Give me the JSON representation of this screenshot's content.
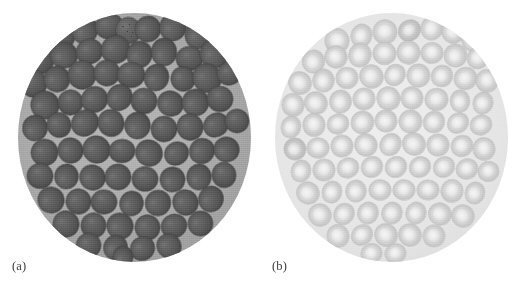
{
  "figure": {
    "type": "micrograph-figure",
    "background_color": "#ffffff",
    "width": 525,
    "height": 285,
    "panel_count": 2
  },
  "panels": [
    {
      "id": "a",
      "label": "(a)",
      "field_shape": "circle",
      "field_background_color": "#aeaeae",
      "cell_fill_color": "#5a5a5a",
      "cell_edge_color": "#4e4e4e",
      "contrast": "high",
      "appearance": "dark densely packed rounded cells on mid-gray field",
      "cell_count": 64
    },
    {
      "id": "b",
      "label": "(b)",
      "field_shape": "circle",
      "field_background_color": "#e8e8e8",
      "cell_fill_color": "#d4d4d4",
      "cell_edge_color": "#c2c2c2",
      "contrast": "low",
      "appearance": "pale biconcave cells with light centers on near-white field",
      "cell_count": 78
    }
  ],
  "cells_a": [
    {
      "x": 41,
      "y": 23,
      "r": 15.5,
      "k": "p"
    },
    {
      "x": 66,
      "y": 16,
      "r": 14.5,
      "k": "p"
    },
    {
      "x": 91,
      "y": 13,
      "r": 14.0,
      "k": "p"
    },
    {
      "x": 110,
      "y": 17,
      "r": 12.5,
      "k": "spk"
    },
    {
      "x": 130,
      "y": 16,
      "r": 13.0,
      "k": "p"
    },
    {
      "x": 155,
      "y": 14,
      "r": 14.0,
      "k": "p"
    },
    {
      "x": 180,
      "y": 21,
      "r": 14.5,
      "k": "p"
    },
    {
      "x": 21,
      "y": 46,
      "r": 14.5,
      "k": "p"
    },
    {
      "x": 46,
      "y": 42,
      "r": 13.0,
      "k": "p"
    },
    {
      "x": 71,
      "y": 38,
      "r": 13.5,
      "k": "p"
    },
    {
      "x": 97,
      "y": 36,
      "r": 14.5,
      "k": "p"
    },
    {
      "x": 121,
      "y": 41,
      "r": 13.5,
      "k": "p"
    },
    {
      "x": 146,
      "y": 39,
      "r": 14.0,
      "k": "p"
    },
    {
      "x": 171,
      "y": 45,
      "r": 13.5,
      "k": "p"
    },
    {
      "x": 196,
      "y": 40,
      "r": 14.5,
      "k": "p"
    },
    {
      "x": 15,
      "y": 70,
      "r": 13.5,
      "k": "p"
    },
    {
      "x": 39,
      "y": 66,
      "r": 13.0,
      "k": "p"
    },
    {
      "x": 64,
      "y": 62,
      "r": 14.0,
      "k": "p"
    },
    {
      "x": 89,
      "y": 60,
      "r": 13.0,
      "k": "p"
    },
    {
      "x": 113,
      "y": 62,
      "r": 14.0,
      "k": "p"
    },
    {
      "x": 138,
      "y": 64,
      "r": 13.5,
      "k": "p"
    },
    {
      "x": 165,
      "y": 66,
      "r": 12.0,
      "k": "p"
    },
    {
      "x": 189,
      "y": 65,
      "r": 14.0,
      "k": "p"
    },
    {
      "x": 211,
      "y": 60,
      "r": 12.5,
      "k": "p"
    },
    {
      "x": 27,
      "y": 92,
      "r": 14.0,
      "k": "p"
    },
    {
      "x": 52,
      "y": 89,
      "r": 12.5,
      "k": "p"
    },
    {
      "x": 76,
      "y": 86,
      "r": 13.5,
      "k": "p"
    },
    {
      "x": 101,
      "y": 84,
      "r": 13.5,
      "k": "p"
    },
    {
      "x": 126,
      "y": 88,
      "r": 13.0,
      "k": "p"
    },
    {
      "x": 152,
      "y": 90,
      "r": 12.5,
      "k": "p"
    },
    {
      "x": 177,
      "y": 89,
      "r": 13.5,
      "k": "p"
    },
    {
      "x": 202,
      "y": 86,
      "r": 13.0,
      "k": "p"
    },
    {
      "x": 17,
      "y": 115,
      "r": 13.0,
      "k": "p"
    },
    {
      "x": 41,
      "y": 112,
      "r": 12.0,
      "k": "p"
    },
    {
      "x": 67,
      "y": 110,
      "r": 14.0,
      "k": "p"
    },
    {
      "x": 93,
      "y": 110,
      "r": 13.0,
      "k": "p"
    },
    {
      "x": 119,
      "y": 112,
      "r": 13.5,
      "k": "p"
    },
    {
      "x": 146,
      "y": 116,
      "r": 13.0,
      "k": "p"
    },
    {
      "x": 172,
      "y": 114,
      "r": 13.0,
      "k": "p"
    },
    {
      "x": 198,
      "y": 112,
      "r": 13.0,
      "k": "p"
    },
    {
      "x": 219,
      "y": 108,
      "r": 12.0,
      "k": "p"
    },
    {
      "x": 26,
      "y": 139,
      "r": 13.5,
      "k": "p"
    },
    {
      "x": 52,
      "y": 137,
      "r": 12.5,
      "k": "p"
    },
    {
      "x": 78,
      "y": 136,
      "r": 13.5,
      "k": "p"
    },
    {
      "x": 104,
      "y": 138,
      "r": 13.0,
      "k": "p"
    },
    {
      "x": 131,
      "y": 140,
      "r": 13.0,
      "k": "p"
    },
    {
      "x": 158,
      "y": 140,
      "r": 12.5,
      "k": "p"
    },
    {
      "x": 184,
      "y": 138,
      "r": 13.0,
      "k": "p"
    },
    {
      "x": 208,
      "y": 136,
      "r": 12.5,
      "k": "p"
    },
    {
      "x": 22,
      "y": 163,
      "r": 13.0,
      "k": "p"
    },
    {
      "x": 48,
      "y": 163,
      "r": 12.5,
      "k": "p"
    },
    {
      "x": 74,
      "y": 164,
      "r": 12.5,
      "k": "p"
    },
    {
      "x": 100,
      "y": 164,
      "r": 13.0,
      "k": "p"
    },
    {
      "x": 127,
      "y": 166,
      "r": 13.0,
      "k": "p"
    },
    {
      "x": 154,
      "y": 166,
      "r": 12.5,
      "k": "p"
    },
    {
      "x": 181,
      "y": 164,
      "r": 13.0,
      "k": "p"
    },
    {
      "x": 206,
      "y": 162,
      "r": 12.0,
      "k": "p"
    },
    {
      "x": 33,
      "y": 187,
      "r": 13.0,
      "k": "p"
    },
    {
      "x": 60,
      "y": 188,
      "r": 12.5,
      "k": "p"
    },
    {
      "x": 86,
      "y": 189,
      "r": 13.0,
      "k": "p"
    },
    {
      "x": 113,
      "y": 190,
      "r": 12.5,
      "k": "p"
    },
    {
      "x": 140,
      "y": 190,
      "r": 13.0,
      "k": "p"
    },
    {
      "x": 167,
      "y": 189,
      "r": 12.5,
      "k": "p"
    },
    {
      "x": 193,
      "y": 186,
      "r": 13.0,
      "k": "p"
    },
    {
      "x": 48,
      "y": 211,
      "r": 13.0,
      "k": "p"
    },
    {
      "x": 75,
      "y": 212,
      "r": 12.5,
      "k": "p"
    },
    {
      "x": 102,
      "y": 213,
      "r": 13.0,
      "k": "p"
    },
    {
      "x": 129,
      "y": 214,
      "r": 12.5,
      "k": "p"
    },
    {
      "x": 156,
      "y": 213,
      "r": 13.0,
      "k": "p"
    },
    {
      "x": 182,
      "y": 210,
      "r": 12.5,
      "k": "p"
    },
    {
      "x": 70,
      "y": 232,
      "r": 12.5,
      "k": "p"
    },
    {
      "x": 97,
      "y": 234,
      "r": 12.5,
      "k": "p"
    },
    {
      "x": 124,
      "y": 235,
      "r": 12.5,
      "k": "p"
    },
    {
      "x": 151,
      "y": 233,
      "r": 12.0,
      "k": "p"
    },
    {
      "x": 105,
      "y": 244,
      "r": 11.0,
      "k": "p"
    }
  ],
  "cells_b": [
    {
      "x": 62,
      "y": 28,
      "r": 12.0,
      "k": "p"
    },
    {
      "x": 86,
      "y": 22,
      "r": 11.5,
      "k": "p"
    },
    {
      "x": 110,
      "y": 19,
      "r": 12.0,
      "k": "p"
    },
    {
      "x": 134,
      "y": 17,
      "r": 11.5,
      "k": "dk"
    },
    {
      "x": 157,
      "y": 15,
      "r": 12.0,
      "k": "p"
    },
    {
      "x": 178,
      "y": 19,
      "r": 11.0,
      "k": "p"
    },
    {
      "x": 197,
      "y": 26,
      "r": 11.5,
      "k": "p"
    },
    {
      "x": 38,
      "y": 48,
      "r": 11.5,
      "k": "p"
    },
    {
      "x": 61,
      "y": 44,
      "r": 11.0,
      "k": "p"
    },
    {
      "x": 85,
      "y": 42,
      "r": 12.0,
      "k": "p"
    },
    {
      "x": 109,
      "y": 40,
      "r": 11.5,
      "k": "p"
    },
    {
      "x": 133,
      "y": 39,
      "r": 11.5,
      "k": "p"
    },
    {
      "x": 157,
      "y": 40,
      "r": 11.0,
      "k": "p"
    },
    {
      "x": 180,
      "y": 42,
      "r": 11.5,
      "k": "p"
    },
    {
      "x": 203,
      "y": 45,
      "r": 11.0,
      "k": "p"
    },
    {
      "x": 25,
      "y": 70,
      "r": 11.0,
      "k": "p"
    },
    {
      "x": 48,
      "y": 67,
      "r": 11.5,
      "k": "p"
    },
    {
      "x": 72,
      "y": 65,
      "r": 11.0,
      "k": "p"
    },
    {
      "x": 96,
      "y": 63,
      "r": 11.5,
      "k": "p"
    },
    {
      "x": 120,
      "y": 62,
      "r": 11.0,
      "k": "p"
    },
    {
      "x": 143,
      "y": 62,
      "r": 11.5,
      "k": "p"
    },
    {
      "x": 167,
      "y": 63,
      "r": 11.0,
      "k": "p"
    },
    {
      "x": 190,
      "y": 65,
      "r": 11.5,
      "k": "p"
    },
    {
      "x": 212,
      "y": 68,
      "r": 11.0,
      "k": "p"
    },
    {
      "x": 18,
      "y": 92,
      "r": 11.0,
      "k": "p"
    },
    {
      "x": 41,
      "y": 90,
      "r": 11.0,
      "k": "p"
    },
    {
      "x": 65,
      "y": 88,
      "r": 11.5,
      "k": "p"
    },
    {
      "x": 89,
      "y": 86,
      "r": 11.0,
      "k": "p"
    },
    {
      "x": 113,
      "y": 85,
      "r": 11.5,
      "k": "p"
    },
    {
      "x": 137,
      "y": 85,
      "r": 11.0,
      "k": "p"
    },
    {
      "x": 161,
      "y": 86,
      "r": 11.5,
      "k": "p"
    },
    {
      "x": 185,
      "y": 88,
      "r": 11.0,
      "k": "p"
    },
    {
      "x": 208,
      "y": 90,
      "r": 11.0,
      "k": "p"
    },
    {
      "x": 16,
      "y": 114,
      "r": 11.0,
      "k": "p"
    },
    {
      "x": 39,
      "y": 112,
      "r": 11.0,
      "k": "p"
    },
    {
      "x": 63,
      "y": 111,
      "r": 11.0,
      "k": "p"
    },
    {
      "x": 87,
      "y": 109,
      "r": 11.5,
      "k": "p"
    },
    {
      "x": 111,
      "y": 108,
      "r": 11.0,
      "k": "p"
    },
    {
      "x": 135,
      "y": 108,
      "r": 11.5,
      "k": "p"
    },
    {
      "x": 159,
      "y": 109,
      "r": 11.0,
      "k": "p"
    },
    {
      "x": 183,
      "y": 110,
      "r": 11.0,
      "k": "p"
    },
    {
      "x": 206,
      "y": 112,
      "r": 11.0,
      "k": "p"
    },
    {
      "x": 20,
      "y": 136,
      "r": 11.0,
      "k": "dk"
    },
    {
      "x": 43,
      "y": 135,
      "r": 11.0,
      "k": "p"
    },
    {
      "x": 67,
      "y": 133,
      "r": 11.0,
      "k": "p"
    },
    {
      "x": 91,
      "y": 132,
      "r": 11.0,
      "k": "p"
    },
    {
      "x": 115,
      "y": 131,
      "r": 11.5,
      "k": "p"
    },
    {
      "x": 139,
      "y": 131,
      "r": 11.0,
      "k": "p"
    },
    {
      "x": 163,
      "y": 132,
      "r": 11.0,
      "k": "p"
    },
    {
      "x": 187,
      "y": 133,
      "r": 11.0,
      "k": "p"
    },
    {
      "x": 209,
      "y": 136,
      "r": 11.0,
      "k": "p"
    },
    {
      "x": 26,
      "y": 158,
      "r": 11.0,
      "k": "p"
    },
    {
      "x": 49,
      "y": 157,
      "r": 11.0,
      "k": "p"
    },
    {
      "x": 73,
      "y": 155,
      "r": 11.0,
      "k": "p"
    },
    {
      "x": 97,
      "y": 154,
      "r": 11.0,
      "k": "p"
    },
    {
      "x": 121,
      "y": 154,
      "r": 11.0,
      "k": "p"
    },
    {
      "x": 145,
      "y": 154,
      "r": 11.0,
      "k": "p"
    },
    {
      "x": 169,
      "y": 154,
      "r": 11.0,
      "k": "p"
    },
    {
      "x": 192,
      "y": 156,
      "r": 11.0,
      "k": "p"
    },
    {
      "x": 213,
      "y": 158,
      "r": 10.5,
      "k": "p"
    },
    {
      "x": 33,
      "y": 180,
      "r": 11.0,
      "k": "p"
    },
    {
      "x": 57,
      "y": 179,
      "r": 11.0,
      "k": "p"
    },
    {
      "x": 81,
      "y": 178,
      "r": 11.0,
      "k": "p"
    },
    {
      "x": 105,
      "y": 177,
      "r": 11.0,
      "k": "p"
    },
    {
      "x": 129,
      "y": 177,
      "r": 11.0,
      "k": "p"
    },
    {
      "x": 153,
      "y": 177,
      "r": 11.0,
      "k": "p"
    },
    {
      "x": 177,
      "y": 178,
      "r": 11.0,
      "k": "p"
    },
    {
      "x": 200,
      "y": 180,
      "r": 11.0,
      "k": "p"
    },
    {
      "x": 45,
      "y": 202,
      "r": 11.0,
      "k": "p"
    },
    {
      "x": 69,
      "y": 201,
      "r": 11.0,
      "k": "p"
    },
    {
      "x": 93,
      "y": 200,
      "r": 11.0,
      "k": "p"
    },
    {
      "x": 117,
      "y": 200,
      "r": 11.0,
      "k": "p"
    },
    {
      "x": 141,
      "y": 200,
      "r": 11.0,
      "k": "p"
    },
    {
      "x": 165,
      "y": 201,
      "r": 11.0,
      "k": "p"
    },
    {
      "x": 188,
      "y": 203,
      "r": 11.0,
      "k": "p"
    },
    {
      "x": 63,
      "y": 223,
      "r": 11.0,
      "k": "p"
    },
    {
      "x": 87,
      "y": 222,
      "r": 11.0,
      "k": "p"
    },
    {
      "x": 111,
      "y": 222,
      "r": 11.0,
      "k": "p"
    },
    {
      "x": 135,
      "y": 222,
      "r": 11.0,
      "k": "p"
    },
    {
      "x": 159,
      "y": 223,
      "r": 11.0,
      "k": "p"
    },
    {
      "x": 96,
      "y": 240,
      "r": 10.5,
      "k": "p"
    },
    {
      "x": 120,
      "y": 240,
      "r": 10.5,
      "k": "p"
    }
  ]
}
